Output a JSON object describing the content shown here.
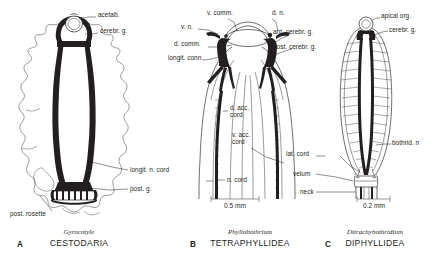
{
  "figure": {
    "background_color": "#ffffff",
    "ink_color": "#231f20"
  },
  "panels": [
    {
      "letter": "A",
      "genus": "Gyrocotyle",
      "order": "CESTODARIA",
      "scale_bar": null,
      "labels": [
        {
          "id": "acetab",
          "text": "acetab.",
          "x": 98,
          "y": 15,
          "align": "left"
        },
        {
          "id": "cerebr-g",
          "text": "cerebr. g.",
          "x": 100,
          "y": 31,
          "align": "left"
        },
        {
          "id": "longit-n-cord",
          "text": "longit. n. cord",
          "x": 130,
          "y": 173,
          "align": "left"
        },
        {
          "id": "post-g",
          "text": "post. g.",
          "x": 130,
          "y": 192,
          "align": "left"
        },
        {
          "id": "post-rosette",
          "text": "post. rosette",
          "x": 10,
          "y": 214,
          "align": "left"
        }
      ]
    },
    {
      "letter": "B",
      "genus": "Phyllobothrium",
      "order": "TETRAPHYLLIDEA",
      "scale_bar": {
        "label": "0.5 mm",
        "x": 211,
        "y": 205,
        "length": 48
      },
      "labels": [
        {
          "id": "v-comm",
          "text": "v. comm.",
          "x": 207,
          "y": 13,
          "align": "left"
        },
        {
          "id": "d-n",
          "text": "d. n.",
          "x": 272,
          "y": 13,
          "align": "left"
        },
        {
          "id": "v-n",
          "text": "v. n.",
          "x": 181,
          "y": 25,
          "align": "left"
        },
        {
          "id": "ant-cerebr-g",
          "text": "ant. cerebr. g.",
          "x": 273,
          "y": 31,
          "align": "left"
        },
        {
          "id": "d-comm",
          "text": "d. comm.",
          "x": 175,
          "y": 43,
          "align": "left"
        },
        {
          "id": "post-cerebr-g",
          "text": "post. cerebr. g.",
          "x": 273,
          "y": 45,
          "align": "left"
        },
        {
          "id": "longit-conn",
          "text": "longit. conn.",
          "x": 170,
          "y": 56,
          "align": "left"
        },
        {
          "id": "d-acc-cord",
          "text": "d. acc.\ncord",
          "x": 230,
          "y": 110,
          "align": "left"
        },
        {
          "id": "v-acc-cord",
          "text": "v. acc.\ncord",
          "x": 232,
          "y": 137,
          "align": "left"
        },
        {
          "id": "n-cord",
          "text": "n. cord",
          "x": 227,
          "y": 178,
          "align": "left"
        }
      ]
    },
    {
      "letter": "C",
      "genus": "Ditrachybothridium",
      "order": "DIPHYLLIDEA",
      "scale_bar": {
        "label": "0.2 mm",
        "x": 357,
        "y": 205,
        "length": 33
      },
      "labels": [
        {
          "id": "apical-org",
          "text": "apical org.",
          "x": 381,
          "y": 16,
          "align": "left"
        },
        {
          "id": "cerebr-g-c",
          "text": "cerebr. g.",
          "x": 389,
          "y": 30,
          "align": "left"
        },
        {
          "id": "bothrid-n",
          "text": "bothrid. n",
          "x": 392,
          "y": 142,
          "align": "left"
        },
        {
          "id": "lat-cord",
          "text": "lat. cord",
          "x": 286,
          "y": 153,
          "align": "left"
        },
        {
          "id": "velum",
          "text": "velum",
          "x": 293,
          "y": 172,
          "align": "left"
        },
        {
          "id": "neck",
          "text": "neck",
          "x": 300,
          "y": 190,
          "align": "left"
        }
      ]
    }
  ],
  "leader_lines": {
    "count": 19,
    "stroke": "#231f20",
    "width": 0.5
  }
}
